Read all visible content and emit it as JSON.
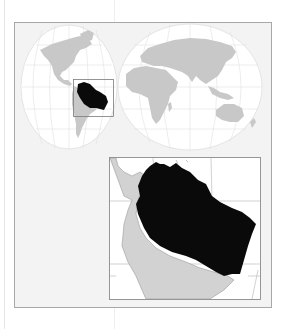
{
  "figure": {
    "type": "locator-map",
    "projection": "interrupted-homolosine",
    "highlighted_region": "Amazon basin (northern South America)",
    "colors": {
      "background": "#ffffff",
      "frame_fill": "#f3f3f3",
      "frame_stroke": "#a8a8a8",
      "ocean": "#ffffff",
      "graticule": "#dcdcdc",
      "land": "#c8c8c8",
      "highlight": "#0a0a0a",
      "inset_stroke": "#8a8a8a"
    },
    "world_map": {
      "lobes": [
        "americas",
        "eurasia-africa-oceania"
      ],
      "locator_box": "northern South America"
    },
    "inset_map": {
      "subject": "northern South America, highlighted region in black"
    }
  }
}
